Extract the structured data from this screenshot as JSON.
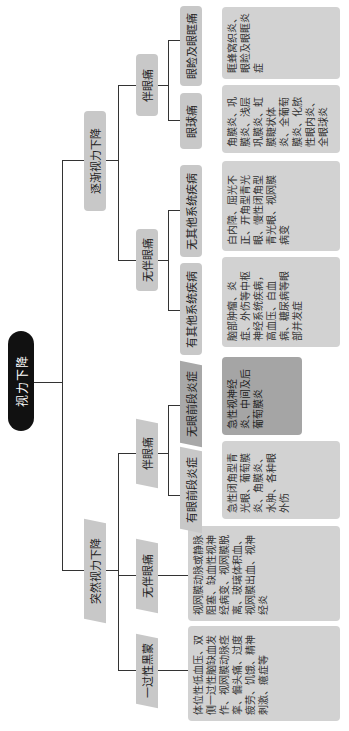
{
  "title": "视力下降",
  "branches": [
    {
      "label": "突然视力下降",
      "children": [
        {
          "label": "一过性黑蒙",
          "detail": "体位性低血压、双侧一过性脑缺血发作、视网膜动脉痉挛、偏头痛、过度疲劳、饥饿、精神刺激、癔症等"
        },
        {
          "label": "无伴眼痛",
          "detail": "视网膜动脉或静脉阻塞、缺血性视神经病变、视网膜脱离、玻璃体积血、视网膜出血、视神经炎"
        },
        {
          "label": "伴眼痛",
          "children": [
            {
              "label": "有眼前段炎症",
              "detail": "急性闭角型青光眼、葡萄膜炎、角膜炎、水肿、各种眼外伤"
            },
            {
              "label": "无眼前段炎症",
              "detail": "急性视神经炎、中间及后葡萄膜炎"
            }
          ]
        }
      ]
    },
    {
      "label": "逐渐视力下降",
      "children": [
        {
          "label": "无伴眼痛",
          "children": [
            {
              "label": "有其他系统疾病",
              "detail": "脑部肿瘤、炎症、外伤等中枢神经系统疾病，高血压、白血病、糖尿病等眼部并发症"
            },
            {
              "label": "无其他系统疾病",
              "detail": "白内障、屈光不正、开角型青光眼、慢性闭角型青光眼、视网膜病变"
            }
          ]
        },
        {
          "label": "伴眼痛",
          "children": [
            {
              "label": "眼球痛",
              "detail": "角膜炎、巩膜炎、浅层巩膜炎、虹膜睫状体炎、全葡萄膜炎、化脓性眼内炎、全眼球炎"
            },
            {
              "label": "眼睑及眼眶痛",
              "detail": "眶蜂窝织炎、眼睑及眼眶炎症"
            }
          ]
        }
      ]
    }
  ]
}
